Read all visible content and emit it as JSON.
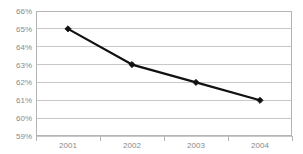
{
  "chart_data": {
    "type": "line",
    "title": "",
    "subtitle": "",
    "xlabel": "",
    "ylabel": "",
    "categories": [
      "2001",
      "2002",
      "2003",
      "2004"
    ],
    "values": [
      65,
      63,
      62,
      61
    ],
    "series": [
      {
        "name": "",
        "values": [
          65,
          63,
          62,
          61
        ]
      }
    ],
    "point_labels": [
      "65%",
      "63%",
      "62%",
      "61%"
    ],
    "ylim": [
      59,
      66
    ],
    "ytick_values": [
      66,
      65,
      64,
      63,
      62,
      61,
      60,
      59
    ],
    "ytick_labels": [
      "66%",
      "65%",
      "64%",
      "63%",
      "62%",
      "61%",
      "60%",
      "59%"
    ],
    "xtick_labels": [
      "2001",
      "2002",
      "2003",
      "2004"
    ],
    "grid": true,
    "grid_axis": "y",
    "legend": false,
    "legend_position": "none",
    "marker": "diamond",
    "annotations": []
  },
  "style": {
    "background_color": "#ffffff",
    "line_color": "#111111",
    "marker_color": "#111111",
    "grid_color": "#c8c8c8",
    "frame_color": "#b4b4b4",
    "axis_label_color": "#8a8a8a",
    "tick_color": "#b4b4b4"
  },
  "geometry": {
    "plot_left": 36,
    "plot_right": 292,
    "plot_top": 11,
    "plot_bottom": 136,
    "point_x": [
      68,
      132,
      196,
      260
    ],
    "tick_x": [
      36,
      100,
      164,
      228,
      292
    ],
    "label_x": [
      68,
      132,
      196,
      260
    ],
    "label_baseline_y": 148
  }
}
